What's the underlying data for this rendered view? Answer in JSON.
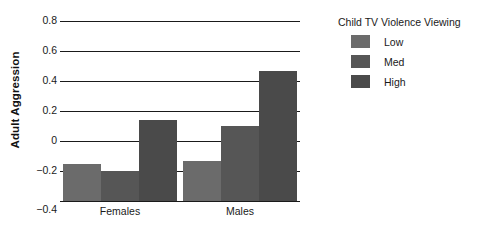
{
  "chart_data": {
    "type": "bar",
    "title": "",
    "xlabel": "",
    "ylabel": "Adult Aggression",
    "categories": [
      "Females",
      "Males"
    ],
    "series": [
      {
        "name": "Low",
        "values": [
          -0.15,
          -0.13
        ],
        "color": "#6b6b6b"
      },
      {
        "name": "Med",
        "values": [
          -0.2,
          0.1
        ],
        "color": "#565656"
      },
      {
        "name": "High",
        "values": [
          0.14,
          0.47
        ],
        "color": "#4a4a4a"
      }
    ],
    "legend_title": "Child TV Violence Viewing",
    "legend_position": "right",
    "ylim": [
      -0.4,
      0.8
    ],
    "yticks": [
      0.8,
      0.6,
      0.4,
      0.2,
      0,
      -0.2,
      -0.4
    ],
    "ytick_labels": [
      "0.8",
      "0.6",
      "0.4",
      "0.2",
      "0",
      "−0.2",
      "−0.4"
    ],
    "grid": true,
    "baseline": -0.4
  }
}
